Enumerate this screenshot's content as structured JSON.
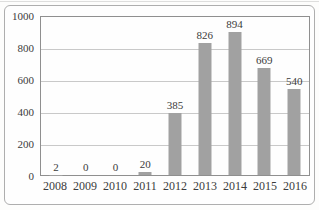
{
  "chart_data": {
    "type": "bar",
    "title": "",
    "categories": [
      "2008",
      "2009",
      "2010",
      "2011",
      "2012",
      "2013",
      "2014",
      "2015",
      "2016"
    ],
    "values": [
      2,
      0,
      0,
      20,
      385,
      826,
      894,
      669,
      540
    ],
    "value_labels": [
      "2",
      "0",
      "0",
      "20",
      "385",
      "826",
      "894",
      "669",
      "540"
    ],
    "xlabel": "",
    "ylabel": "",
    "ylim": [
      0,
      1000
    ],
    "y_ticks": [
      0,
      200,
      400,
      600,
      800,
      1000
    ],
    "grid": "horizontal",
    "legend_position": "none",
    "colors": {
      "bar": "#a1a1a1",
      "gridline": "#c9c9c9",
      "plot_border": "#8f8f8f",
      "frame_border": "#aeaeae",
      "text": "#3b3b3b",
      "background": "#fdfdfc"
    }
  }
}
